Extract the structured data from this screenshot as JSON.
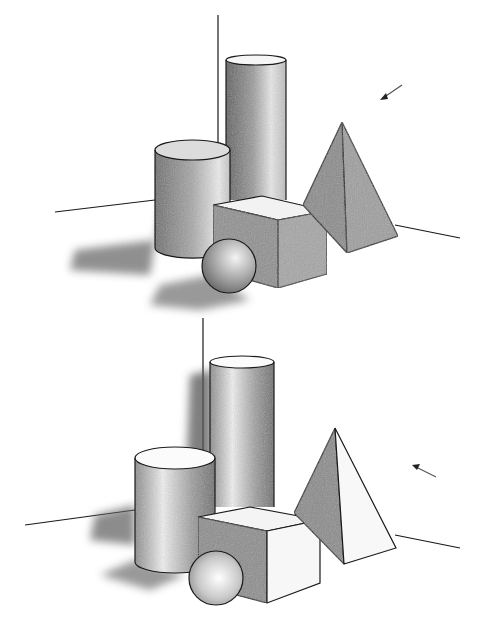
{
  "image": {
    "subject": "Pencil drawing of geometric solids (two studies)",
    "background": "#ffffff",
    "stroke_color": "#1a1a1a",
    "panels": [
      {
        "id": "top",
        "light_direction": "from upper right",
        "light_arrow": "arrow pointing down-left",
        "objects": [
          "tall-cylinder",
          "short-cylinder",
          "cube",
          "sphere",
          "pyramid"
        ],
        "shadow_side": "left"
      },
      {
        "id": "bottom",
        "light_direction": "from right",
        "light_arrow": "arrow pointing left",
        "objects": [
          "tall-cylinder",
          "short-cylinder",
          "cube",
          "sphere",
          "pyramid"
        ],
        "shadow_side": "left"
      }
    ]
  }
}
